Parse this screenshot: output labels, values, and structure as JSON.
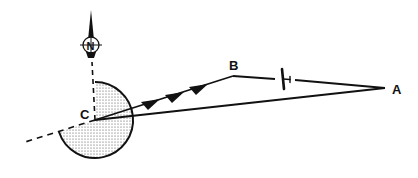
{
  "diagram": {
    "colors": {
      "ink": "#111111",
      "background": "#ffffff",
      "stipple": "#444444"
    },
    "north_indicator": {
      "label": "N",
      "icon": "north-arrow-compass-icon"
    },
    "points": [
      {
        "id": "A",
        "label": "A",
        "x": 385,
        "y": 88
      },
      {
        "id": "B",
        "label": "B",
        "x": 233,
        "y": 76
      },
      {
        "id": "C",
        "label": "C",
        "x": 95,
        "y": 120
      }
    ],
    "segments": [
      {
        "from": "C",
        "to": "B",
        "style": "solid",
        "arrowheads": 3
      },
      {
        "from": "B",
        "to": "A",
        "style": "solid",
        "symbol": "aircraft-icon"
      },
      {
        "from": "A",
        "to": "C",
        "style": "solid"
      },
      {
        "from": "C",
        "to": "north",
        "style": "dashed"
      },
      {
        "from": "C",
        "to": "south-west",
        "style": "dashed"
      }
    ],
    "sector": {
      "center": "C",
      "radius": 38,
      "fill": "stippled",
      "icon": "stippled-sector"
    }
  }
}
